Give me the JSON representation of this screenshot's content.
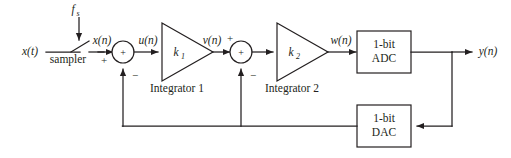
{
  "diagram": {
    "colors": {
      "ink": "#231f20",
      "background": "#ffffff"
    },
    "signals": {
      "input_analog": "x(t)",
      "sampled": "x(n)",
      "clock": "f",
      "clock_sub": "s",
      "sum1_out": "u(n)",
      "integ1_out": "v(n)",
      "integ2_out": "w(n)",
      "output": "y(n)"
    },
    "blocks": {
      "sampler_label": "sampler",
      "gain1": "k",
      "gain1_sub": "1",
      "gain2": "k",
      "gain2_sub": "2",
      "integrator1_label": "Integrator 1",
      "integrator2_label": "Integrator 2",
      "adc_line1": "1-bit",
      "adc_line2": "ADC",
      "dac_line1": "1-bit",
      "dac_line2": "DAC"
    },
    "summer1": {
      "name": "summing-junction-1",
      "center_sign": "+",
      "input_sign_left": "+",
      "input_sign_bottom": "−"
    },
    "summer2": {
      "name": "summing-junction-2",
      "center_sign": "+",
      "input_sign_top": "+",
      "input_sign_bottom": "−"
    }
  }
}
